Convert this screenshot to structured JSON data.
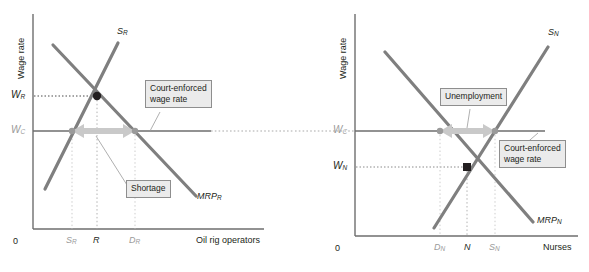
{
  "figure": {
    "type": "two-panel-economics-diagram",
    "colors": {
      "curve": "#7f7f7f",
      "axis": "#6e6e6e",
      "dot_equilibrium": "#231f20",
      "dot_constrained": "#9a9a9a",
      "arrow": "#c9c9c9",
      "callout_fill": "#ebebeb",
      "callout_border": "#8e8e8e",
      "gray_label": "#9a9a9a",
      "black_label": "#231f20"
    },
    "panels": [
      {
        "id": "oil-rig-operators",
        "y_axis_title": "Wage rate",
        "x_axis_title": "Oil rig operators",
        "origin_label": "0",
        "y_ticks": [
          {
            "base": "W",
            "sub": "R",
            "color": "black"
          },
          {
            "base": "W",
            "sub": "C",
            "color": "gray"
          }
        ],
        "x_ticks": [
          {
            "base": "S",
            "sub": "R",
            "color": "gray"
          },
          {
            "base": "R",
            "sub": "",
            "color": "black"
          },
          {
            "base": "D",
            "sub": "R",
            "color": "gray"
          }
        ],
        "curves": [
          {
            "name": "supply",
            "label_base": "S",
            "label_sub": "R"
          },
          {
            "name": "marginal-revenue-product",
            "label_base": "MRP",
            "label_sub": "R"
          }
        ],
        "callouts": [
          {
            "id": "court-enforced",
            "lines": [
              "Court-enforced",
              "wage rate"
            ]
          },
          {
            "id": "shortage",
            "lines": [
              "Shortage"
            ]
          }
        ],
        "arrow_label": "Shortage",
        "note": "Court-enforced wage W_C is below equilibrium W_R, creating a shortage between S_R and D_R."
      },
      {
        "id": "nurses",
        "y_axis_title": "Wage rate",
        "x_axis_title": "Nurses",
        "origin_label": "0",
        "y_ticks": [
          {
            "base": "W",
            "sub": "C",
            "color": "gray"
          },
          {
            "base": "W",
            "sub": "N",
            "color": "black"
          }
        ],
        "x_ticks": [
          {
            "base": "D",
            "sub": "N",
            "color": "gray"
          },
          {
            "base": "N",
            "sub": "",
            "color": "black"
          },
          {
            "base": "S",
            "sub": "N",
            "color": "gray"
          }
        ],
        "curves": [
          {
            "name": "supply",
            "label_base": "S",
            "label_sub": "N"
          },
          {
            "name": "marginal-revenue-product",
            "label_base": "MRP",
            "label_sub": "N"
          }
        ],
        "callouts": [
          {
            "id": "unemployment",
            "lines": [
              "Unemployment"
            ]
          },
          {
            "id": "court-enforced",
            "lines": [
              "Court-enforced",
              "wage rate"
            ]
          }
        ],
        "arrow_label": "Unemployment",
        "note": "Court-enforced wage W_C is above equilibrium W_N, creating unemployment between D_N and S_N."
      }
    ]
  }
}
